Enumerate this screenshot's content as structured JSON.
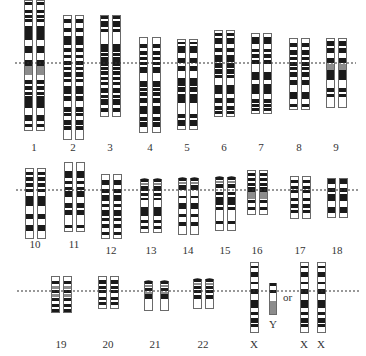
{
  "colors": {
    "dark_band": "#1a1a1a",
    "grey_band": "#8c8c8c",
    "outline": "#6a6a6a",
    "centromere_line": "#333333",
    "background": "#ffffff"
  },
  "rows": [
    {
      "line_y": 63,
      "x1": 15,
      "x2": 356
    },
    {
      "line_y": 190,
      "x1": 16,
      "x2": 358
    },
    {
      "line_y": 291,
      "x1": 17,
      "x2": 360
    }
  ],
  "or_label": {
    "text": "or",
    "x": 283,
    "y": 291
  },
  "chromosomes": [
    {
      "label": "1",
      "label_x": 34,
      "label_y": 141,
      "top": 0,
      "bottom": 130,
      "xs": [
        24,
        36
      ],
      "bands": [
        [
          2,
          3,
          "d"
        ],
        [
          10,
          3,
          "d"
        ],
        [
          15,
          3,
          "d"
        ],
        [
          19,
          3,
          "d"
        ],
        [
          26,
          14,
          "d"
        ],
        [
          46,
          7,
          "d"
        ],
        [
          60,
          6,
          "d"
        ],
        [
          66,
          9,
          "g"
        ],
        [
          80,
          4,
          "d"
        ],
        [
          86,
          4,
          "d"
        ],
        [
          92,
          3,
          "d"
        ],
        [
          96,
          12,
          "d"
        ],
        [
          115,
          6,
          "d"
        ],
        [
          124,
          3,
          "d"
        ]
      ]
    },
    {
      "label": "2",
      "label_x": 73,
      "label_y": 141,
      "top": 15,
      "bottom": 139,
      "xs": [
        63,
        75
      ],
      "bands": [
        [
          19,
          4,
          "d"
        ],
        [
          28,
          4,
          "d"
        ],
        [
          36,
          9,
          "d"
        ],
        [
          48,
          4,
          "d"
        ],
        [
          55,
          3,
          "d"
        ],
        [
          61,
          4,
          "d"
        ],
        [
          67,
          3,
          "d"
        ],
        [
          72,
          5,
          "d"
        ],
        [
          79,
          3,
          "d"
        ],
        [
          86,
          8,
          "d"
        ],
        [
          96,
          5,
          "d"
        ],
        [
          107,
          5,
          "d"
        ],
        [
          113,
          3,
          "d"
        ],
        [
          120,
          5,
          "d"
        ],
        [
          126,
          4,
          "d"
        ]
      ]
    },
    {
      "label": "3",
      "label_x": 110,
      "label_y": 141,
      "top": 15,
      "bottom": 116,
      "xs": [
        100,
        112
      ],
      "bands": [
        [
          16,
          3,
          "d"
        ],
        [
          21,
          6,
          "d"
        ],
        [
          29,
          3,
          "d"
        ],
        [
          44,
          8,
          "d"
        ],
        [
          53,
          3,
          "d"
        ],
        [
          57,
          9,
          "d"
        ],
        [
          67,
          3,
          "d"
        ],
        [
          71,
          4,
          "d"
        ],
        [
          77,
          3,
          "d"
        ],
        [
          82,
          3,
          "d"
        ],
        [
          88,
          5,
          "d"
        ],
        [
          95,
          3,
          "d"
        ],
        [
          99,
          6,
          "d"
        ],
        [
          108,
          4,
          "d"
        ]
      ]
    },
    {
      "label": "4",
      "label_x": 150,
      "label_y": 141,
      "top": 37,
      "bottom": 132,
      "xs": [
        139,
        152
      ],
      "bands": [
        [
          44,
          4,
          "d"
        ],
        [
          51,
          4,
          "d"
        ],
        [
          57,
          3,
          "d"
        ],
        [
          62,
          3,
          "d"
        ],
        [
          67,
          6,
          "d"
        ],
        [
          81,
          6,
          "d"
        ],
        [
          88,
          3,
          "d"
        ],
        [
          92,
          4,
          "d"
        ],
        [
          98,
          5,
          "d"
        ],
        [
          106,
          8,
          "d"
        ],
        [
          117,
          4,
          "d"
        ],
        [
          122,
          5,
          "d"
        ]
      ]
    },
    {
      "label": "5",
      "label_x": 187,
      "label_y": 141,
      "top": 39,
      "bottom": 129,
      "xs": [
        177,
        189
      ],
      "bands": [
        [
          42,
          2,
          "d"
        ],
        [
          46,
          7,
          "d"
        ],
        [
          58,
          5,
          "d"
        ],
        [
          66,
          5,
          "d"
        ],
        [
          78,
          8,
          "d"
        ],
        [
          87,
          5,
          "d"
        ],
        [
          94,
          9,
          "d"
        ],
        [
          114,
          4,
          "d"
        ],
        [
          120,
          6,
          "d"
        ]
      ]
    },
    {
      "label": "6",
      "label_x": 224,
      "label_y": 141,
      "top": 30,
      "bottom": 116,
      "xs": [
        214,
        226
      ],
      "bands": [
        [
          33,
          3,
          "d"
        ],
        [
          38,
          6,
          "d"
        ],
        [
          48,
          4,
          "d"
        ],
        [
          55,
          7,
          "d"
        ],
        [
          63,
          5,
          "d"
        ],
        [
          69,
          5,
          "d"
        ],
        [
          75,
          3,
          "d"
        ],
        [
          85,
          9,
          "d"
        ],
        [
          98,
          5,
          "d"
        ],
        [
          106,
          4,
          "d"
        ],
        [
          111,
          3,
          "d"
        ]
      ]
    },
    {
      "label": "7",
      "label_x": 261,
      "label_y": 141,
      "top": 33,
      "bottom": 113,
      "xs": [
        251,
        263
      ],
      "bands": [
        [
          37,
          7,
          "d"
        ],
        [
          49,
          3,
          "d"
        ],
        [
          54,
          4,
          "d"
        ],
        [
          60,
          4,
          "d"
        ],
        [
          72,
          8,
          "d"
        ],
        [
          84,
          10,
          "d"
        ],
        [
          99,
          4,
          "d"
        ],
        [
          104,
          3,
          "d"
        ],
        [
          108,
          3,
          "d"
        ]
      ]
    },
    {
      "label": "8",
      "label_x": 299,
      "label_y": 141,
      "top": 38,
      "bottom": 109,
      "xs": [
        289,
        301
      ],
      "bands": [
        [
          43,
          4,
          "d"
        ],
        [
          50,
          5,
          "d"
        ],
        [
          57,
          3,
          "d"
        ],
        [
          62,
          4,
          "d"
        ],
        [
          67,
          3,
          "d"
        ],
        [
          72,
          5,
          "d"
        ],
        [
          80,
          5,
          "d"
        ],
        [
          92,
          7,
          "d"
        ],
        [
          104,
          3,
          "d"
        ]
      ]
    },
    {
      "label": "9",
      "label_x": 336,
      "label_y": 141,
      "top": 38,
      "bottom": 107,
      "xs": [
        326,
        338
      ],
      "bands": [
        [
          41,
          5,
          "d"
        ],
        [
          48,
          5,
          "d"
        ],
        [
          58,
          5,
          "d"
        ],
        [
          64,
          6,
          "g"
        ],
        [
          70,
          10,
          "d"
        ],
        [
          88,
          4,
          "d"
        ],
        [
          94,
          3,
          "d"
        ]
      ]
    },
    {
      "label": "10",
      "label_x": 35,
      "label_y": 238,
      "top": 168,
      "bottom": 238,
      "xs": [
        25,
        37
      ],
      "bands": [
        [
          172,
          3,
          "d"
        ],
        [
          177,
          4,
          "d"
        ],
        [
          183,
          4,
          "d"
        ],
        [
          189,
          3,
          "d"
        ],
        [
          196,
          10,
          "d"
        ],
        [
          214,
          5,
          "d"
        ],
        [
          225,
          6,
          "d"
        ]
      ]
    },
    {
      "label": "11",
      "label_x": 74,
      "label_y": 238,
      "top": 162,
      "bottom": 231,
      "xs": [
        64,
        76
      ],
      "bands": [
        [
          171,
          7,
          "d"
        ],
        [
          181,
          3,
          "d"
        ],
        [
          187,
          3,
          "d"
        ],
        [
          191,
          6,
          "d"
        ],
        [
          203,
          5,
          "d"
        ],
        [
          210,
          5,
          "d"
        ],
        [
          225,
          3,
          "d"
        ]
      ]
    },
    {
      "label": "12",
      "label_x": 111,
      "label_y": 244,
      "top": 174,
      "bottom": 238,
      "xs": [
        101,
        113
      ],
      "bands": [
        [
          180,
          5,
          "d"
        ],
        [
          189,
          4,
          "d"
        ],
        [
          195,
          6,
          "d"
        ],
        [
          204,
          3,
          "d"
        ],
        [
          210,
          6,
          "d"
        ],
        [
          218,
          3,
          "d"
        ],
        [
          224,
          4,
          "d"
        ],
        [
          232,
          3,
          "d"
        ]
      ]
    },
    {
      "label": "13",
      "label_x": 151,
      "label_y": 244,
      "top": 179,
      "bottom": 232,
      "xs": [
        140,
        153
      ],
      "satellite": true,
      "bands": [
        [
          179,
          3,
          "d"
        ],
        [
          183,
          2,
          "g"
        ],
        [
          186,
          5,
          "d"
        ],
        [
          193,
          3,
          "d"
        ],
        [
          198,
          2,
          "d"
        ],
        [
          207,
          9,
          "d"
        ],
        [
          220,
          3,
          "d"
        ],
        [
          226,
          3,
          "d"
        ]
      ]
    },
    {
      "label": "14",
      "label_x": 188,
      "label_y": 244,
      "top": 178,
      "bottom": 234,
      "xs": [
        178,
        190
      ],
      "satellite": true,
      "bands": [
        [
          178,
          3,
          "d"
        ],
        [
          182,
          2,
          "g"
        ],
        [
          185,
          5,
          "d"
        ],
        [
          196,
          2,
          "d"
        ],
        [
          203,
          6,
          "d"
        ],
        [
          214,
          3,
          "d"
        ],
        [
          222,
          4,
          "d"
        ]
      ]
    },
    {
      "label": "15",
      "label_x": 225,
      "label_y": 244,
      "top": 177,
      "bottom": 230,
      "xs": [
        215,
        227
      ],
      "satellite": true,
      "bands": [
        [
          177,
          3,
          "d"
        ],
        [
          181,
          2,
          "g"
        ],
        [
          184,
          4,
          "d"
        ],
        [
          192,
          3,
          "d"
        ],
        [
          197,
          8,
          "d"
        ],
        [
          207,
          3,
          "d"
        ],
        [
          221,
          3,
          "d"
        ]
      ]
    },
    {
      "label": "16",
      "label_x": 257,
      "label_y": 244,
      "top": 170,
      "bottom": 214,
      "xs": [
        247,
        259
      ],
      "bands": [
        [
          173,
          3,
          "d"
        ],
        [
          178,
          3,
          "d"
        ],
        [
          183,
          3,
          "d"
        ],
        [
          187,
          5,
          "d"
        ],
        [
          192,
          7,
          "g"
        ],
        [
          200,
          3,
          "d"
        ],
        [
          207,
          3,
          "d"
        ]
      ]
    },
    {
      "label": "17",
      "label_x": 300,
      "label_y": 244,
      "top": 176,
      "bottom": 218,
      "xs": [
        290,
        302
      ],
      "bands": [
        [
          180,
          3,
          "d"
        ],
        [
          186,
          3,
          "d"
        ],
        [
          190,
          3,
          "d"
        ],
        [
          198,
          3,
          "d"
        ],
        [
          204,
          4,
          "d"
        ],
        [
          210,
          3,
          "d"
        ]
      ]
    },
    {
      "label": "18",
      "label_x": 337,
      "label_y": 244,
      "top": 178,
      "bottom": 217,
      "xs": [
        327,
        339
      ],
      "bands": [
        [
          179,
          5,
          "d"
        ],
        [
          188,
          4,
          "d"
        ],
        [
          194,
          7,
          "d"
        ],
        [
          207,
          6,
          "d"
        ]
      ]
    },
    {
      "label": "19",
      "label_x": 61,
      "label_y": 338,
      "top": 276,
      "bottom": 312,
      "xs": [
        51,
        63
      ],
      "bands": [
        [
          281,
          3,
          "d"
        ],
        [
          286,
          3,
          "g"
        ],
        [
          290,
          3,
          "d"
        ],
        [
          294,
          3,
          "g"
        ],
        [
          298,
          3,
          "d"
        ],
        [
          304,
          3,
          "d"
        ],
        [
          309,
          3,
          "d"
        ]
      ]
    },
    {
      "label": "20",
      "label_x": 108,
      "label_y": 338,
      "top": 276,
      "bottom": 308,
      "xs": [
        98,
        110
      ],
      "bands": [
        [
          280,
          4,
          "d"
        ],
        [
          286,
          3,
          "d"
        ],
        [
          290,
          3,
          "d"
        ],
        [
          297,
          3,
          "d"
        ],
        [
          302,
          3,
          "d"
        ]
      ]
    },
    {
      "label": "21",
      "label_x": 155,
      "label_y": 338,
      "top": 281,
      "bottom": 310,
      "xs": [
        144,
        160
      ],
      "satellite": true,
      "bands": [
        [
          281,
          3,
          "d"
        ],
        [
          285,
          2,
          "g"
        ],
        [
          288,
          3,
          "d"
        ],
        [
          292,
          2,
          "g"
        ],
        [
          294,
          5,
          "d"
        ]
      ]
    },
    {
      "label": "22",
      "label_x": 203,
      "label_y": 338,
      "top": 279,
      "bottom": 308,
      "xs": [
        193,
        205
      ],
      "satellite": true,
      "bands": [
        [
          279,
          3,
          "d"
        ],
        [
          283,
          2,
          "g"
        ],
        [
          286,
          3,
          "d"
        ],
        [
          290,
          3,
          "d"
        ],
        [
          295,
          4,
          "d"
        ]
      ]
    },
    {
      "label": "X",
      "label_x": 254,
      "label_y": 338,
      "top": 262,
      "bottom": 332,
      "xs": [
        250
      ],
      "bands": [
        [
          266,
          2,
          "d"
        ],
        [
          272,
          5,
          "d"
        ],
        [
          282,
          2,
          "d"
        ],
        [
          289,
          5,
          "d"
        ],
        [
          300,
          8,
          "d"
        ],
        [
          312,
          3,
          "d"
        ],
        [
          318,
          5,
          "d"
        ],
        [
          324,
          3,
          "d"
        ]
      ]
    },
    {
      "label": "Y",
      "label_x": 273,
      "label_y": 318,
      "top": 283,
      "bottom": 314,
      "xs": [
        269
      ],
      "width": 7,
      "bands": [
        [
          283,
          3,
          "d"
        ],
        [
          290,
          3,
          "d"
        ],
        [
          301,
          13,
          "g"
        ]
      ]
    },
    {
      "label": "X",
      "label_x": 304,
      "label_y": 338,
      "top": 262,
      "bottom": 332,
      "xs": [
        300
      ],
      "bands": [
        [
          266,
          2,
          "d"
        ],
        [
          272,
          5,
          "d"
        ],
        [
          282,
          2,
          "d"
        ],
        [
          289,
          5,
          "d"
        ],
        [
          300,
          8,
          "d"
        ],
        [
          312,
          3,
          "d"
        ],
        [
          318,
          5,
          "d"
        ],
        [
          324,
          3,
          "d"
        ]
      ]
    },
    {
      "label": "X",
      "label_x": 321,
      "label_y": 338,
      "top": 262,
      "bottom": 332,
      "xs": [
        317
      ],
      "bands": [
        [
          266,
          2,
          "d"
        ],
        [
          272,
          5,
          "d"
        ],
        [
          282,
          2,
          "d"
        ],
        [
          289,
          5,
          "d"
        ],
        [
          300,
          8,
          "d"
        ],
        [
          312,
          3,
          "d"
        ],
        [
          318,
          5,
          "d"
        ],
        [
          324,
          3,
          "d"
        ]
      ]
    }
  ]
}
